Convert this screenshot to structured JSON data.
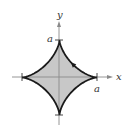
{
  "figure": {
    "type": "astroid",
    "axes": {
      "x_label": "x",
      "y_label": "y"
    },
    "cusp_labels": {
      "top": "a",
      "right": "a"
    },
    "colors": {
      "fill": "#c8c8c8",
      "curve": "#1a1a1a",
      "axis": "#777777",
      "text": "#333333"
    },
    "orientation": "counterclockwise"
  }
}
